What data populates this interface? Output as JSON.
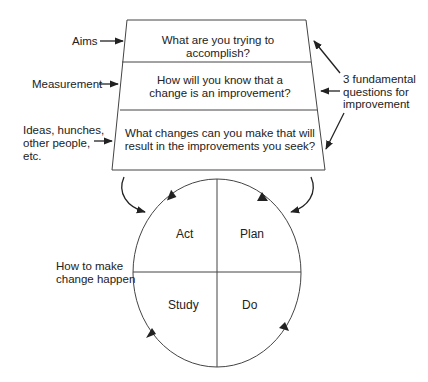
{
  "questions": {
    "aims": "What are you trying to accomplish?",
    "measurement_line1": "How will you know that a",
    "measurement_line2": "change is an improvement?",
    "changes_line1": "What changes can you make that will",
    "changes_line2": "result in the improvements you seek?"
  },
  "left_labels": {
    "aims": "Aims",
    "measurement": "Measurement",
    "ideas_line1": "Ideas, hunches,",
    "ideas_line2": "other people,",
    "ideas_line3": "etc."
  },
  "right_label": {
    "line1": "3 fundamental",
    "line2": "questions for",
    "line3": "improvement"
  },
  "cycle": {
    "act": "Act",
    "plan": "Plan",
    "study": "Study",
    "do": "Do",
    "label_line1": "How to make",
    "label_line2": "change happen"
  }
}
